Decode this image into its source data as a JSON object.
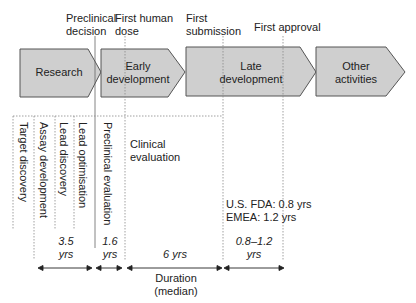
{
  "milestones": {
    "preclinical_decision": "Preclinical\ndecision",
    "first_human_dose": "First human\ndose",
    "first_submission": "First\nsubmission",
    "first_approval": "First approval"
  },
  "phases": [
    {
      "label": "Research"
    },
    {
      "label": "Early\ndevelopment"
    },
    {
      "label": "Late\ndevelopment"
    },
    {
      "label": "Other\nactivities"
    }
  ],
  "research_steps": [
    "Target discovery",
    "Assay development",
    "Lead discovery",
    "Lead optimisation"
  ],
  "preclinical_step": "Preclinical evaluation",
  "clinical_label": "Clinical\nevaluation",
  "regulatory": {
    "fda": "U.S. FDA: 0.8 yrs",
    "emea": "EMEA: 1.2 yrs"
  },
  "durations": [
    {
      "label": "3.5\nyrs"
    },
    {
      "label": "1.6\nyrs"
    },
    {
      "label": "6 yrs"
    },
    {
      "label": "0.8–1.2\nyrs"
    }
  ],
  "duration_caption": "Duration\n(median)",
  "colors": {
    "phase_fill": "#cfcfcf",
    "phase_stroke": "#555555",
    "dotted": "#888888"
  }
}
